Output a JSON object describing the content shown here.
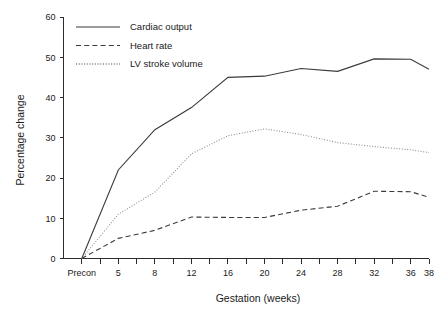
{
  "chart_data": {
    "type": "line",
    "title": "",
    "xlabel": "Gestation (weeks)",
    "ylabel": "Percentage change",
    "categories": [
      "Precon",
      "5",
      "8",
      "12",
      "16",
      "20",
      "24",
      "28",
      "32",
      "36",
      "38"
    ],
    "x_tick_labels": [
      "Precon",
      "5",
      "8",
      "12",
      "16",
      "20",
      "24",
      "28",
      "32",
      "36",
      "38"
    ],
    "y_tick_labels": [
      "0",
      "10",
      "20",
      "30",
      "40",
      "50",
      "60"
    ],
    "y_ticks": [
      0,
      10,
      20,
      30,
      40,
      50,
      60
    ],
    "ylim": [
      0,
      60
    ],
    "grid": false,
    "legend_position": "top-left",
    "series": [
      {
        "name": "Cardiac output",
        "style": "solid",
        "color": "#3a3a3a",
        "values": [
          0,
          22.0,
          32.0,
          37.5,
          45.0,
          45.3,
          47.2,
          46.5,
          49.6,
          49.5,
          47.0
        ]
      },
      {
        "name": "Heart rate",
        "style": "dashed",
        "color": "#3a3a3a",
        "values": [
          0,
          5.0,
          7.0,
          10.3,
          10.2,
          10.2,
          12.0,
          13.0,
          16.7,
          16.6,
          15.2
        ]
      },
      {
        "name": "LV stroke volume",
        "style": "dotted",
        "color": "#8f8f8f",
        "values": [
          0,
          11.0,
          16.5,
          26.0,
          30.5,
          32.2,
          30.8,
          28.8,
          27.8,
          27.0,
          26.3
        ]
      }
    ]
  },
  "legend": {
    "items": [
      {
        "label": "Cardiac output"
      },
      {
        "label": "Heart rate"
      },
      {
        "label": "LV stroke volume"
      }
    ]
  },
  "axes": {
    "x_title": "Gestation (weeks)",
    "y_title": "Percentage change"
  }
}
